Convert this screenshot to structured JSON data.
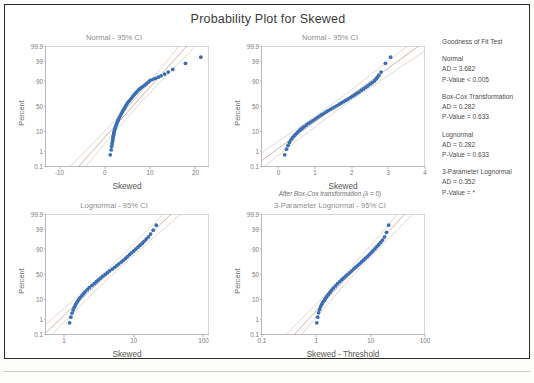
{
  "title": "Probability Plot for Skewed",
  "caption": "After Box-Cox transformation (λ = 0)",
  "legend": {
    "heading": "Goodness of Fit Test",
    "groups": [
      {
        "name": "Normal",
        "ad": "AD = 3.682",
        "p": "P-Value < 0.005"
      },
      {
        "name": "Box-Cox Transformation",
        "ad": "AD = 0.282",
        "p": "P-Value = 0.633"
      },
      {
        "name": "Lognormal",
        "ad": "AD = 0.282",
        "p": "P-Value = 0.633"
      },
      {
        "name": "3-Parameter Lognormal",
        "ad": "AD = 0.352",
        "p": "P-Value = *"
      }
    ]
  },
  "colors": {
    "marker": "#3b6fb5",
    "fit_line": "#c9a99a",
    "ci_line": "#d9cfc6",
    "axis": "#b9b9b9",
    "text": "#4d4d4d",
    "subtitle": "#8d8d8d",
    "frame": "#2b2b2b"
  },
  "chart_data": [
    {
      "type": "scatter",
      "id": "normal-raw",
      "title": "Normal - 95% CI",
      "xlabel": "Skewed",
      "ylabel": "Percent",
      "xticks": [
        "-10",
        "0",
        "10",
        "20"
      ],
      "xtick_values": [
        -10,
        0,
        10,
        20
      ],
      "xlim": [
        -13,
        23
      ],
      "yticks": [
        "0.1",
        "1",
        "10",
        "50",
        "90",
        "99",
        "99.9"
      ],
      "ytick_values": [
        0.1,
        1,
        10,
        50,
        90,
        99,
        99.9
      ],
      "grid": false,
      "legend_position": "right",
      "x": [
        1.2,
        1.4,
        1.5,
        1.6,
        1.7,
        1.75,
        1.8,
        1.85,
        1.9,
        1.95,
        2.0,
        2.05,
        2.1,
        2.2,
        2.3,
        2.4,
        2.5,
        2.6,
        2.7,
        2.8,
        2.9,
        3.0,
        3.2,
        3.4,
        3.6,
        3.8,
        4.0,
        4.2,
        4.4,
        4.6,
        4.8,
        5.0,
        5.3,
        5.6,
        5.9,
        6.2,
        6.5,
        6.8,
        7.1,
        7.4,
        7.7,
        8.0,
        8.4,
        8.8,
        9.2,
        9.6,
        10.0,
        10.6,
        11.2,
        11.8,
        12.4,
        13.2,
        14.0,
        15.0,
        17.8,
        21.2
      ],
      "y": [
        0.6,
        1.2,
        1.9,
        2.6,
        3.4,
        4.2,
        5.0,
        5.8,
        6.6,
        7.4,
        8.2,
        9.0,
        9.8,
        11.4,
        13.0,
        14.6,
        16.2,
        17.8,
        19.4,
        21.0,
        22.6,
        24.2,
        27.4,
        30.6,
        33.8,
        37.0,
        40.2,
        43.4,
        46.6,
        49.8,
        53.0,
        56.2,
        59.4,
        62.6,
        65.8,
        69.0,
        72.2,
        74.6,
        77.0,
        79.4,
        81.0,
        82.6,
        84.2,
        85.8,
        87.4,
        89.0,
        90.6,
        91.5,
        92.3,
        93.1,
        94.0,
        95.0,
        96.0,
        97.0,
        98.6,
        99.4
      ]
    },
    {
      "type": "scatter",
      "id": "normal-boxcox",
      "title": "Normal - 95% CI",
      "xlabel": "Skewed",
      "ylabel": "Percent",
      "xticks": [
        "0",
        "1",
        "2",
        "3",
        "4"
      ],
      "xtick_values": [
        0,
        1,
        2,
        3,
        4
      ],
      "xlim": [
        -0.45,
        4
      ],
      "yticks": [
        "0.1",
        "1",
        "10",
        "50",
        "90",
        "99",
        "99.9"
      ],
      "ytick_values": [
        0.1,
        1,
        10,
        50,
        90,
        99,
        99.9
      ],
      "grid": false,
      "x": [
        0.17,
        0.22,
        0.26,
        0.3,
        0.34,
        0.38,
        0.42,
        0.46,
        0.5,
        0.54,
        0.58,
        0.62,
        0.66,
        0.7,
        0.76,
        0.82,
        0.88,
        0.94,
        1.0,
        1.06,
        1.12,
        1.18,
        1.24,
        1.3,
        1.36,
        1.42,
        1.48,
        1.54,
        1.6,
        1.66,
        1.72,
        1.78,
        1.84,
        1.9,
        1.96,
        2.02,
        2.08,
        2.14,
        2.2,
        2.26,
        2.32,
        2.38,
        2.44,
        2.5,
        2.56,
        2.62,
        2.66,
        2.7,
        2.74,
        2.8,
        2.92,
        3.06
      ],
      "y": [
        0.6,
        1.3,
        2.1,
        3.0,
        4.0,
        5.0,
        6.0,
        7.0,
        8.2,
        9.4,
        10.6,
        11.8,
        13.0,
        14.4,
        16.4,
        18.4,
        20.4,
        22.4,
        25.0,
        27.6,
        30.2,
        32.8,
        35.4,
        38.0,
        40.6,
        43.2,
        45.8,
        48.4,
        51.0,
        53.6,
        56.2,
        58.8,
        61.4,
        64.0,
        66.6,
        69.2,
        71.6,
        74.0,
        76.4,
        78.8,
        81.0,
        83.0,
        85.0,
        87.0,
        88.6,
        90.2,
        91.6,
        93.0,
        94.4,
        96.0,
        98.6,
        99.4
      ]
    },
    {
      "type": "scatter",
      "id": "lognormal",
      "title": "Lognormal - 95% CI",
      "xlabel": "Skewed",
      "ylabel": "Percent",
      "xscale": "log",
      "xticks": [
        "1",
        "10",
        "100"
      ],
      "xtick_values": [
        1,
        10,
        100
      ],
      "xlim": [
        0.55,
        120
      ],
      "yticks": [
        "0.1",
        "1",
        "10",
        "50",
        "90",
        "99",
        "99.9"
      ],
      "ytick_values": [
        0.1,
        1,
        10,
        50,
        90,
        99,
        99.9
      ],
      "grid": false,
      "x": [
        1.2,
        1.25,
        1.3,
        1.35,
        1.4,
        1.45,
        1.5,
        1.56,
        1.62,
        1.7,
        1.8,
        1.9,
        2.0,
        2.15,
        2.3,
        2.5,
        2.7,
        2.9,
        3.1,
        3.35,
        3.6,
        3.9,
        4.2,
        4.5,
        4.9,
        5.3,
        5.7,
        6.1,
        6.6,
        7.1,
        7.6,
        8.1,
        8.7,
        9.3,
        10.0,
        10.7,
        11.5,
        12.3,
        13.2,
        14.1,
        15.1,
        16.2,
        17.4,
        19.0,
        21.0
      ],
      "y": [
        0.6,
        1.3,
        2.2,
        3.2,
        4.3,
        5.4,
        6.6,
        8.0,
        9.5,
        11.2,
        13.4,
        15.6,
        18.0,
        21.0,
        24.0,
        27.5,
        31.0,
        34.5,
        38.0,
        41.8,
        45.5,
        49.2,
        52.8,
        56.4,
        60.0,
        63.4,
        66.6,
        69.8,
        73.0,
        76.0,
        78.8,
        81.4,
        84.0,
        86.2,
        88.2,
        90.0,
        91.6,
        93.0,
        94.2,
        95.4,
        96.4,
        97.2,
        98.0,
        98.8,
        99.4
      ]
    },
    {
      "type": "scatter",
      "id": "lognormal-3p",
      "title": "3-Parameter Lognormal - 95% CI",
      "xlabel": "Skewed - Threshold",
      "ylabel": "Percent",
      "xscale": "log",
      "xticks": [
        "0.1",
        "1",
        "10",
        "100"
      ],
      "xtick_values": [
        0.1,
        1,
        10,
        100
      ],
      "xlim": [
        0.1,
        100
      ],
      "yticks": [
        "0.1",
        "1",
        "10",
        "50",
        "90",
        "99",
        "99.9"
      ],
      "ytick_values": [
        0.1,
        1,
        10,
        50,
        90,
        99,
        99.9
      ],
      "grid": false,
      "x": [
        1.02,
        1.06,
        1.1,
        1.15,
        1.2,
        1.26,
        1.32,
        1.4,
        1.48,
        1.56,
        1.66,
        1.78,
        1.9,
        2.05,
        2.25,
        2.45,
        2.7,
        2.95,
        3.2,
        3.5,
        3.8,
        4.15,
        4.5,
        4.9,
        5.3,
        5.8,
        6.3,
        6.8,
        7.4,
        8.0,
        8.7,
        9.4,
        10.2,
        11.0,
        12.0,
        13.0,
        14.1,
        15.3,
        16.6,
        18.0,
        19.6,
        21.4
      ],
      "y": [
        0.6,
        1.3,
        2.3,
        3.4,
        4.6,
        5.9,
        7.3,
        8.9,
        10.6,
        12.4,
        14.6,
        17.2,
        20.0,
        23.2,
        27.0,
        30.8,
        34.6,
        38.4,
        42.0,
        45.8,
        49.4,
        53.0,
        56.6,
        60.2,
        63.6,
        67.0,
        70.2,
        73.2,
        76.2,
        79.0,
        81.6,
        84.0,
        86.2,
        88.2,
        90.2,
        92.0,
        93.4,
        94.8,
        96.0,
        97.2,
        98.4,
        99.4
      ]
    }
  ]
}
